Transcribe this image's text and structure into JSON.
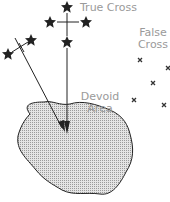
{
  "labels": {
    "true_cross": "True Cross",
    "false_cross_line1": "False",
    "false_cross_line2": "Cross",
    "devoid_line1": "Devoid",
    "devoid_line2": "Area"
  },
  "colors": {
    "ink": "#222222",
    "label": "#9a9a9a",
    "area_fill": "#cfcfcf"
  }
}
